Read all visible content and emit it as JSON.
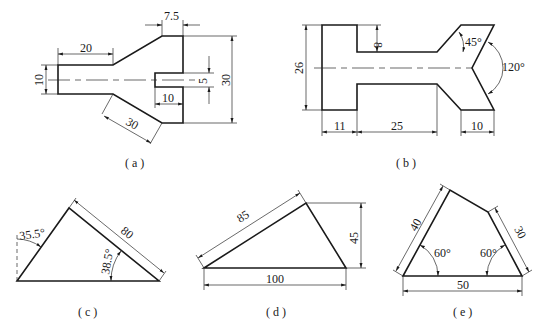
{
  "figures": [
    {
      "id": "a",
      "caption": "( a )",
      "dimensions": {
        "top_width": "7.5",
        "left_length": "20",
        "left_height": "10",
        "slot_height": "5",
        "overall_height": "30",
        "slot_depth": "10",
        "slant_length": "30"
      }
    },
    {
      "id": "b",
      "caption": "( b )",
      "dimensions": {
        "overall_height": "26",
        "notch_depth": "8",
        "chamfer_angle": "45°",
        "vee_angle": "120°",
        "left_width": "11",
        "neck_length": "25",
        "right_width": "10"
      }
    },
    {
      "id": "c",
      "caption": "( c )",
      "dimensions": {
        "left_angle": "35.5°",
        "hypotenuse": "80",
        "inner_angle": "38.5°"
      }
    },
    {
      "id": "d",
      "caption": "( d )",
      "dimensions": {
        "slant_side": "85",
        "height": "45",
        "base": "100"
      }
    },
    {
      "id": "e",
      "caption": "( e )",
      "dimensions": {
        "left_side": "40",
        "right_side": "30",
        "left_angle": "60°",
        "right_angle": "60°",
        "base": "50"
      }
    }
  ],
  "colors": {
    "line": "#1a1a1a",
    "background": "#ffffff"
  }
}
